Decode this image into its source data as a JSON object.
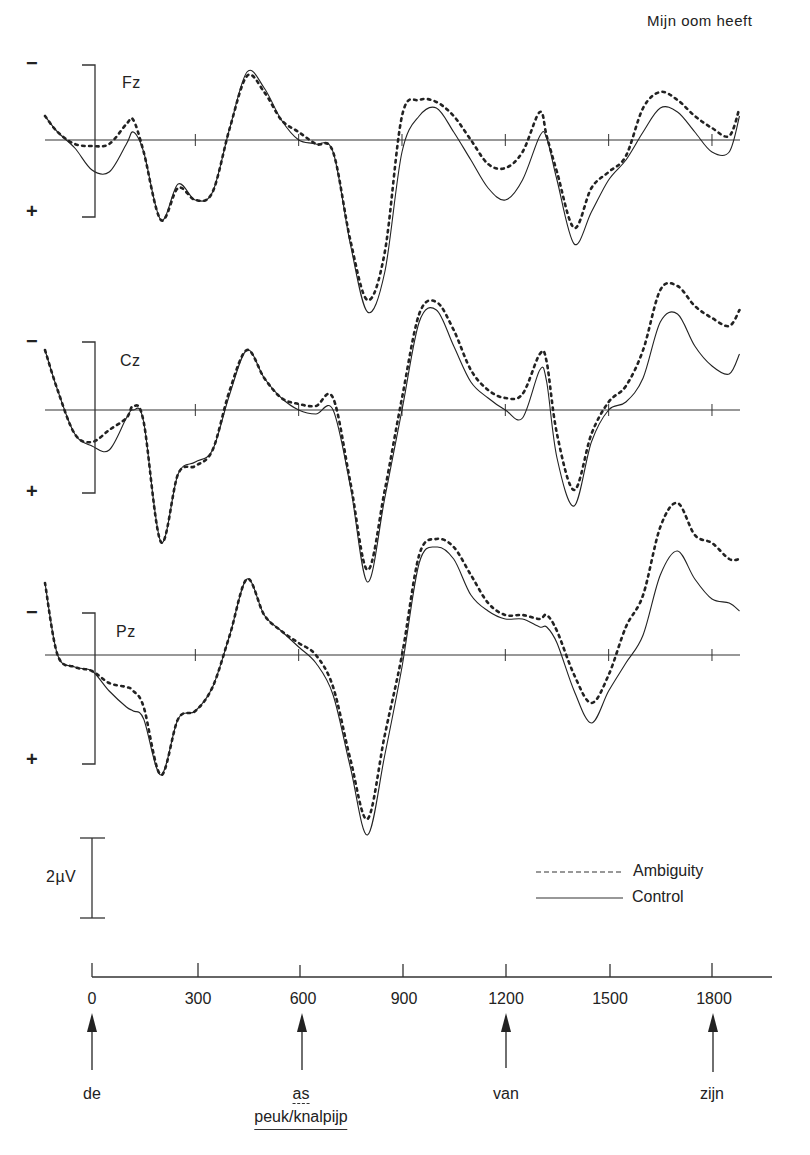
{
  "title": "Mijn oom heeft",
  "legend": {
    "ambiguity": "Ambiguity",
    "control": "Control"
  },
  "scale_bar": "2µV",
  "polarity": {
    "negative": "−",
    "positive": "+"
  },
  "axis": {
    "ticks": [
      "0",
      "300",
      "600",
      "900",
      "1200",
      "1500",
      "1800"
    ],
    "unit": "ms"
  },
  "words": {
    "w0": "de",
    "w1_ambiguous": "as",
    "w1_control": "peuk/knalpijp",
    "w2": "van",
    "w3": "zijn"
  },
  "channels": {
    "fz": "Fz",
    "cz": "Cz",
    "pz": "Pz"
  },
  "chart_data": {
    "type": "line",
    "title": "Mijn oom heeft",
    "xlabel": "Time (ms)",
    "ylabel": "Amplitude (µV), negative up",
    "xlim": [
      -150,
      1880
    ],
    "x_ticks": [
      0,
      300,
      600,
      900,
      1200,
      1500,
      1800
    ],
    "scale_bar_uV": 2,
    "legend": [
      "Ambiguity (dashed)",
      "Control (solid)"
    ],
    "legend_position": "lower right",
    "annotations": [
      {
        "x": 0,
        "label": "de"
      },
      {
        "x": 600,
        "label": "as (ambiguous) / peuk/knalpijp (control)"
      },
      {
        "x": 1200,
        "label": "van"
      },
      {
        "x": 1800,
        "label": "zijn"
      }
    ],
    "x": [
      -150,
      -100,
      -50,
      0,
      50,
      100,
      120,
      150,
      200,
      250,
      300,
      350,
      400,
      450,
      500,
      550,
      600,
      650,
      700,
      750,
      800,
      850,
      900,
      950,
      1000,
      1050,
      1100,
      1150,
      1200,
      1250,
      1300,
      1320,
      1350,
      1400,
      1450,
      1500,
      1550,
      1600,
      1650,
      1700,
      1750,
      1800,
      1850,
      1880
    ],
    "panels": [
      {
        "channel": "Fz",
        "series": [
          {
            "name": "Ambiguity",
            "values": [
              0.6,
              0.2,
              -0.1,
              -0.15,
              -0.1,
              0.4,
              0.5,
              -0.3,
              -2.0,
              -1.2,
              -1.5,
              -1.3,
              0.3,
              1.6,
              1.2,
              0.5,
              0.2,
              -0.1,
              -0.3,
              -2.5,
              -4.0,
              -2.8,
              0.6,
              1.0,
              0.95,
              0.6,
              0.0,
              -0.6,
              -0.7,
              -0.3,
              0.7,
              0.1,
              -0.8,
              -2.2,
              -1.2,
              -0.8,
              -0.4,
              0.8,
              1.2,
              1.0,
              0.6,
              0.3,
              0.1,
              0.8
            ]
          },
          {
            "name": "Control",
            "values": [
              0.6,
              0.2,
              -0.2,
              -0.75,
              -0.8,
              -0.1,
              0.2,
              -0.3,
              -2.0,
              -1.1,
              -1.5,
              -1.3,
              0.3,
              1.7,
              1.3,
              0.5,
              0.0,
              -0.1,
              -0.3,
              -2.6,
              -4.3,
              -3.3,
              -0.3,
              0.6,
              0.8,
              0.2,
              -0.5,
              -1.2,
              -1.5,
              -1.0,
              0.1,
              0.05,
              -1.0,
              -2.6,
              -1.8,
              -1.0,
              -0.5,
              0.2,
              0.8,
              0.7,
              0.2,
              -0.3,
              -0.3,
              0.6
            ]
          }
        ]
      },
      {
        "channel": "Cz",
        "series": [
          {
            "name": "Ambiguity",
            "values": [
              1.5,
              0.5,
              -0.6,
              -0.8,
              -0.5,
              -0.2,
              0.1,
              -0.3,
              -3.3,
              -1.6,
              -1.4,
              -1.0,
              0.5,
              1.5,
              0.8,
              0.3,
              0.15,
              0.1,
              0.3,
              -1.8,
              -4.0,
              -2.0,
              0.3,
              2.4,
              2.7,
              2.0,
              1.0,
              0.5,
              0.3,
              0.4,
              1.4,
              1.2,
              -0.6,
              -2.0,
              -0.6,
              0.2,
              0.6,
              1.5,
              3.0,
              3.1,
              2.6,
              2.3,
              2.1,
              2.5
            ]
          },
          {
            "name": "Control",
            "values": [
              1.5,
              0.5,
              -0.6,
              -0.9,
              -1.0,
              -0.2,
              0.0,
              -0.3,
              -3.3,
              -1.6,
              -1.3,
              -1.0,
              0.4,
              1.5,
              0.8,
              0.3,
              0.0,
              -0.1,
              0.0,
              -1.9,
              -4.3,
              -2.2,
              0.0,
              2.2,
              2.5,
              1.6,
              0.7,
              0.3,
              0.0,
              -0.2,
              1.0,
              0.7,
              -1.2,
              -2.4,
              -0.8,
              0.0,
              0.2,
              0.8,
              2.2,
              2.4,
              1.6,
              1.1,
              0.9,
              1.4
            ]
          }
        ]
      },
      {
        "channel": "Pz",
        "series": [
          {
            "name": "Ambiguity",
            "values": [
              1.8,
              0.0,
              -0.3,
              -0.4,
              -0.7,
              -0.8,
              -0.9,
              -1.3,
              -3.0,
              -1.6,
              -1.4,
              -0.8,
              0.5,
              1.9,
              1.0,
              0.6,
              0.3,
              0.0,
              -0.8,
              -2.6,
              -4.1,
              -2.0,
              0.0,
              2.5,
              2.9,
              2.7,
              2.0,
              1.3,
              1.0,
              1.0,
              0.9,
              1.0,
              0.6,
              -0.5,
              -1.2,
              -0.5,
              0.7,
              1.5,
              3.2,
              3.8,
              3.0,
              2.8,
              2.4,
              2.4
            ]
          },
          {
            "name": "Control",
            "values": [
              1.8,
              0.0,
              -0.3,
              -0.4,
              -0.9,
              -1.3,
              -1.4,
              -1.6,
              -3.0,
              -1.6,
              -1.4,
              -0.8,
              0.5,
              1.9,
              1.0,
              0.6,
              0.2,
              -0.2,
              -1.0,
              -2.8,
              -4.5,
              -2.5,
              -0.3,
              2.3,
              2.7,
              2.4,
              1.5,
              1.1,
              0.9,
              0.9,
              0.7,
              0.7,
              0.3,
              -0.9,
              -1.7,
              -0.9,
              -0.2,
              0.5,
              2.0,
              2.6,
              1.9,
              1.4,
              1.3,
              1.1
            ]
          }
        ]
      }
    ]
  }
}
